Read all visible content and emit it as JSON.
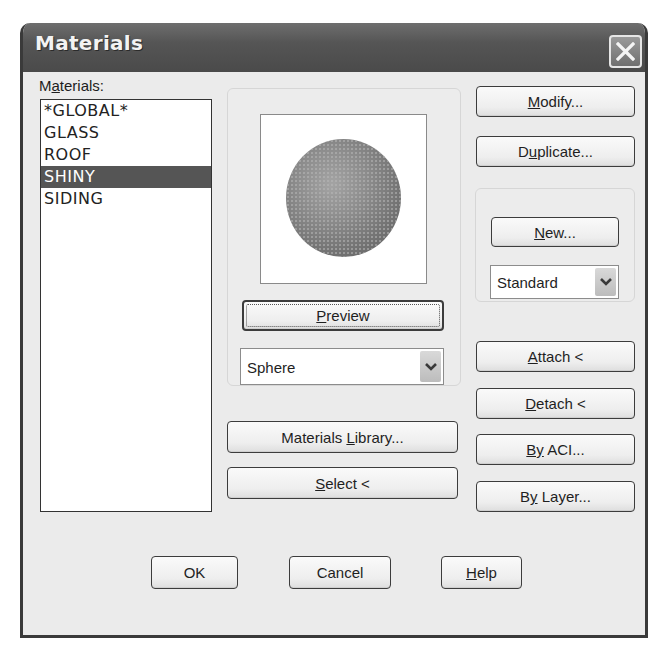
{
  "window": {
    "title": "Materials",
    "close_icon": "close-x-icon"
  },
  "materials_list": {
    "label_prefix": "M",
    "label_underline": "a",
    "label_suffix": "terials:",
    "items": [
      {
        "label": "*GLOBAL*",
        "selected": false
      },
      {
        "label": "GLASS",
        "selected": false
      },
      {
        "label": "ROOF",
        "selected": false
      },
      {
        "label": "SHINY",
        "selected": true
      },
      {
        "label": "SIDING",
        "selected": false
      }
    ]
  },
  "preview": {
    "image": "sphere-preview",
    "button": {
      "u": "P",
      "rest": "review"
    },
    "shape_select": {
      "value": "Sphere"
    }
  },
  "buttons": {
    "materials_library": {
      "pre": "Materials ",
      "u": "L",
      "rest": "ibrary..."
    },
    "select": {
      "u": "S",
      "rest": "elect <"
    },
    "modify": {
      "u": "M",
      "rest": "odify..."
    },
    "duplicate": {
      "pre": "D",
      "u": "u",
      "rest": "plicate..."
    },
    "new": {
      "u": "N",
      "rest": "ew..."
    },
    "attach": {
      "u": "A",
      "rest": "ttach <"
    },
    "detach": {
      "u": "D",
      "rest": "etach <"
    },
    "by_aci": {
      "u": "By",
      "rest": " ACI..."
    },
    "by_layer": {
      "pre": "B",
      "u": "y",
      "rest": " Layer..."
    },
    "ok": "OK",
    "cancel": "Cancel",
    "help": {
      "u": "H",
      "rest": "elp"
    }
  },
  "new_type_select": {
    "value": "Standard"
  },
  "colors": {
    "titlebar": "#555555",
    "dialog_bg": "#ebebeb",
    "selection_bg": "#555555"
  }
}
